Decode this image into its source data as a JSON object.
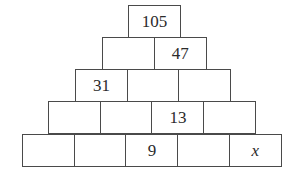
{
  "pyramid": {
    "rows": [
      {
        "cells": [
          "105"
        ]
      },
      {
        "cells": [
          "",
          "47"
        ]
      },
      {
        "cells": [
          "31",
          "",
          ""
        ]
      },
      {
        "cells": [
          "",
          "",
          "13",
          ""
        ]
      },
      {
        "cells": [
          "",
          "",
          "9",
          "",
          "x"
        ]
      }
    ]
  }
}
